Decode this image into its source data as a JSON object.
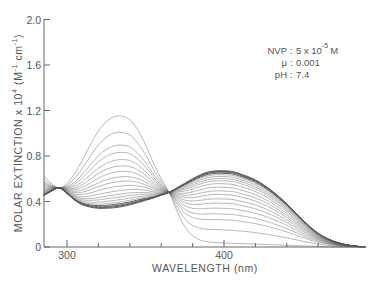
{
  "chart_data": {
    "type": "line",
    "title": "",
    "xlabel": "WAVELENGTH (nm)",
    "ylabel": "MOLAR EXTINCTION x 10^4 (M^-1 cm^-1)",
    "ylabel_parts": {
      "main": "MOLAR  EXTINCTION x 10",
      "exp": "4",
      "units_open": " (M",
      "units_exp1": "-1",
      "units_mid": " cm",
      "units_exp2": "-1",
      "units_close": ")"
    },
    "xlim": [
      285,
      490
    ],
    "ylim": [
      0,
      2.0
    ],
    "x_ticks_major": [
      300,
      400
    ],
    "x_tick_labels": [
      "300",
      "400"
    ],
    "x_ticks_minor": [
      320,
      340,
      360,
      380,
      420,
      440,
      460
    ],
    "y_ticks": [
      0,
      0.4,
      0.8,
      1.2,
      1.6,
      2.0
    ],
    "y_tick_labels": [
      "0",
      "0.4",
      "0.8",
      "1.2",
      "1.6",
      "2.0"
    ],
    "grid": false,
    "legend": null,
    "annotations": [
      {
        "label": "NVP",
        "value": "5 x 10",
        "exp": "-5",
        "unit": "M"
      },
      {
        "label": "μ",
        "value": "0.001"
      },
      {
        "label": "pH",
        "value": "7.4"
      }
    ],
    "isosbestic_points": [
      {
        "x": 295,
        "y": 0.52
      },
      {
        "x": 366,
        "y": 0.48
      }
    ],
    "x": [
      285,
      290,
      295,
      300,
      305,
      310,
      315,
      320,
      325,
      330,
      335,
      340,
      345,
      350,
      355,
      360,
      365,
      370,
      375,
      380,
      385,
      390,
      395,
      400,
      405,
      410,
      420,
      430,
      440,
      450,
      460,
      470,
      480,
      490
    ],
    "series": [
      {
        "name": "initial (UV band, max ~334 nm)",
        "values": [
          0.63,
          0.56,
          0.52,
          0.56,
          0.65,
          0.77,
          0.9,
          1.02,
          1.1,
          1.145,
          1.15,
          1.12,
          1.03,
          0.9,
          0.74,
          0.6,
          0.48,
          0.32,
          0.18,
          0.1,
          0.06,
          0.045,
          0.04,
          0.035,
          0.033,
          0.03,
          0.025,
          0.02,
          0.015,
          0.01,
          0.005,
          0.0,
          0.0,
          0.0
        ]
      },
      {
        "name": "final (visible band, max ~399 nm)",
        "values": [
          0.45,
          0.49,
          0.52,
          0.47,
          0.41,
          0.37,
          0.35,
          0.34,
          0.34,
          0.345,
          0.355,
          0.37,
          0.39,
          0.41,
          0.43,
          0.455,
          0.48,
          0.52,
          0.56,
          0.6,
          0.635,
          0.66,
          0.67,
          0.67,
          0.665,
          0.645,
          0.59,
          0.5,
          0.38,
          0.24,
          0.12,
          0.05,
          0.015,
          0.0
        ]
      }
    ],
    "intermediate_fractions_of_initial": [
      0.82,
      0.68,
      0.6,
      0.52,
      0.45,
      0.39,
      0.33,
      0.28,
      0.23,
      0.18,
      0.14,
      0.11,
      0.08,
      0.055,
      0.035,
      0.02,
      0.01
    ],
    "curve_color": "#555555"
  }
}
